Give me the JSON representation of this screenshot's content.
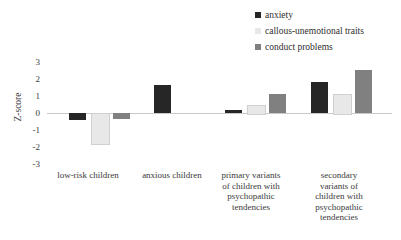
{
  "chart_data": {
    "type": "bar",
    "title": "",
    "xlabel": "",
    "ylabel": "Z-score",
    "ylim": [
      -3,
      3
    ],
    "yticks": [
      "3",
      "2",
      "1",
      "0",
      "-1",
      "-2",
      "-3"
    ],
    "grid": false,
    "legend_position": "top-right",
    "categories": [
      "low-risk children",
      "anxious children",
      "primary variants of children with psychopathic tendencies",
      "secondary variants of children with psychopathic tendencies"
    ],
    "category_lines": [
      [
        "low-risk children"
      ],
      [
        "anxious children"
      ],
      [
        "primary variants",
        "of children with",
        "psychopathic",
        "tendencies"
      ],
      [
        "secondary",
        "variants of",
        "children with",
        "psychopathic",
        "tendencies"
      ]
    ],
    "series": [
      {
        "name": "anxiety",
        "color": "#262626",
        "values": [
          -0.4,
          1.65,
          0.15,
          1.8
        ]
      },
      {
        "name": "callous-unemotional traits",
        "color": "#e8e8e8",
        "values": [
          -1.75,
          0,
          0.5,
          1.1
        ]
      },
      {
        "name": "conduct problems",
        "color": "#808080",
        "values": [
          -0.35,
          0,
          1.1,
          2.55
        ]
      }
    ]
  },
  "legend": {
    "items": [
      {
        "label": "anxiety",
        "color": "#262626"
      },
      {
        "label": "callous-unemotional traits",
        "color": "#e8e8e8"
      },
      {
        "label": "conduct problems",
        "color": "#808080"
      }
    ]
  },
  "axis": {
    "y_title": "Z-score",
    "y_ticks": [
      "3",
      "2",
      "1",
      "0",
      "-1",
      "-2",
      "-3"
    ]
  }
}
